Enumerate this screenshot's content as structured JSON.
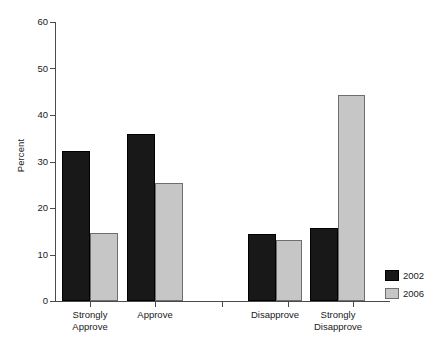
{
  "chart_data": {
    "type": "bar",
    "title": "",
    "subtitle": "",
    "xlabel": "",
    "ylabel": "Percent",
    "ylim": [
      0,
      60
    ],
    "yticks": [
      0,
      10,
      20,
      30,
      40,
      50,
      60
    ],
    "ytick_labels": [
      "0",
      "10",
      "20",
      "30",
      "40",
      "50",
      "60"
    ],
    "grid": false,
    "legend_position": "bottom-right",
    "categories": [
      "Strongly\nApprove",
      "Approve",
      "Disapprove",
      "Strongly\nDisapprove"
    ],
    "series": [
      {
        "name": "2002",
        "color": "#181818",
        "values": [
          32.2,
          36.0,
          14.4,
          15.8
        ]
      },
      {
        "name": "2006",
        "color": "#c6c6c6",
        "values": [
          14.6,
          25.4,
          13.1,
          44.2
        ]
      }
    ]
  },
  "axis": {
    "y_title": "Percent",
    "y_tick_labels": [
      "60",
      "50",
      "40",
      "30",
      "20",
      "10",
      "0"
    ]
  },
  "categories": [
    {
      "label": "Strongly\nApprove"
    },
    {
      "label": "Approve"
    },
    {
      "label": "Disapprove"
    },
    {
      "label": "Strongly\nDisapprove"
    }
  ],
  "legend": {
    "items": [
      {
        "label": "2002",
        "color": "#181818"
      },
      {
        "label": "2006",
        "color": "#c6c6c6"
      }
    ]
  }
}
